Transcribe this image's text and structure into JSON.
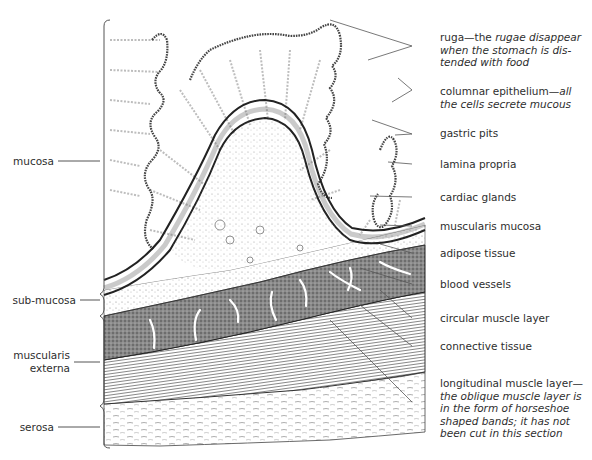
{
  "figure": {
    "left_layers": [
      {
        "id": "mucosa",
        "label": "mucosa"
      },
      {
        "id": "sub-mucosa",
        "label": "sub-mucosa"
      },
      {
        "id": "muscularis-externa",
        "label_line1": "muscularis",
        "label_line2": "externa"
      },
      {
        "id": "serosa",
        "label": "serosa"
      }
    ],
    "right_labels": {
      "ruga": {
        "term": "ruga—the ",
        "note_a": "rugae disappear",
        "note_b": "when the stomach is dis-",
        "note_c": "tended with food"
      },
      "columnar_epithelium": {
        "term": "columnar epithelium—",
        "note_a": "all",
        "note_b": "the cells secrete mucous"
      },
      "gastric_pits": "gastric pits",
      "lamina_propria": "lamina propria",
      "cardiac_glands": "cardiac glands",
      "muscularis_mucosa": "muscularis mucosa",
      "adipose_tissue": "adipose tissue",
      "blood_vessels": "blood vessels",
      "circular_muscle_layer": "circular muscle layer",
      "connective_tissue": "connective tissue",
      "longitudinal_muscle_layer": {
        "term": "longitudinal muscle layer—",
        "note_a": "the oblique muscle layer is",
        "note_b": "in the form of horseshoe",
        "note_c": "shaped bands; it has not",
        "note_d": "been cut in this section"
      }
    },
    "colors": {
      "ink": "#2e2e2e",
      "muscle_dark": "#6a6a6a",
      "background": "#ffffff"
    }
  }
}
